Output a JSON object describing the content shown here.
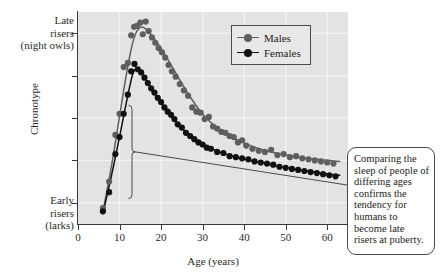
{
  "axes": {
    "y_title": "Chronotype",
    "y_high_label": "Late\nrisers\n(night owls)",
    "y_low_label": "Early\nrisers\n(larks)",
    "x_title": "Age (years)",
    "x_ticks": [
      "0",
      "10",
      "20",
      "30",
      "40",
      "50",
      "60"
    ]
  },
  "legend": {
    "males_label": "Males",
    "females_label": "Females"
  },
  "annotation": {
    "text": "Comparing the sleep of people of differing ages confirms the tendency for humans to become late risers at puberty."
  },
  "colors": {
    "males": "#5e5e5e",
    "females": "#111111",
    "plot_background": "#e3e3e3",
    "gridline": "#f2f2f2",
    "axis": "#3a3a3a"
  },
  "chart_data": {
    "type": "scatter",
    "title": "",
    "xlabel": "Age (years)",
    "ylabel": "Chronotype",
    "xlim": [
      0,
      65
    ],
    "ylim": [
      0,
      10
    ],
    "grid": true,
    "legend_position": "top-right",
    "x_tick_values": [
      0,
      10,
      20,
      30,
      40,
      50,
      60
    ],
    "y_tick_values": [
      1,
      3,
      5,
      7,
      9
    ],
    "annotations": [
      {
        "text": "Comparing the sleep of people of differing ages confirms the tendency for humans to become late risers at puberty.",
        "points_to_x": 13,
        "bracket_x": 13,
        "bracket_y_range": [
          1.2,
          5.6
        ]
      }
    ],
    "series": [
      {
        "name": "Males",
        "color": "#5e5e5e",
        "points": [
          [
            6.0,
            0.75
          ],
          [
            7.5,
            2.0
          ],
          [
            9.0,
            4.2
          ],
          [
            10.0,
            5.2
          ],
          [
            11.0,
            7.4
          ],
          [
            12.0,
            7.6
          ],
          [
            12.8,
            8.9
          ],
          [
            13.5,
            9.3
          ],
          [
            14.2,
            9.35
          ],
          [
            15.0,
            9.5
          ],
          [
            15.6,
            8.95
          ],
          [
            16.3,
            9.55
          ],
          [
            17.0,
            9.1
          ],
          [
            17.8,
            8.8
          ],
          [
            18.6,
            8.55
          ],
          [
            19.4,
            8.3
          ],
          [
            20.2,
            8.1
          ],
          [
            21.0,
            7.85
          ],
          [
            21.8,
            7.5
          ],
          [
            22.6,
            7.2
          ],
          [
            23.5,
            6.95
          ],
          [
            24.5,
            6.6
          ],
          [
            25.5,
            6.3
          ],
          [
            26.5,
            6.05
          ],
          [
            27.5,
            5.5
          ],
          [
            28.5,
            5.3
          ],
          [
            29.5,
            5.25
          ],
          [
            30.5,
            4.95
          ],
          [
            31.5,
            5.05
          ],
          [
            32.5,
            4.6
          ],
          [
            33.5,
            4.5
          ],
          [
            34.5,
            4.35
          ],
          [
            35.5,
            4.3
          ],
          [
            36.5,
            4.15
          ],
          [
            37.5,
            4.1
          ],
          [
            38.5,
            3.85
          ],
          [
            39.5,
            3.95
          ],
          [
            40.5,
            3.7
          ],
          [
            42.0,
            3.55
          ],
          [
            43.5,
            3.45
          ],
          [
            45.0,
            3.4
          ],
          [
            46.5,
            3.5
          ],
          [
            48.0,
            3.25
          ],
          [
            49.5,
            3.3
          ],
          [
            51.0,
            3.15
          ],
          [
            52.5,
            3.2
          ],
          [
            54.0,
            3.1
          ],
          [
            55.5,
            3.05
          ],
          [
            57.0,
            3.0
          ],
          [
            58.5,
            2.95
          ],
          [
            60.0,
            2.9
          ],
          [
            61.5,
            2.85
          ]
        ],
        "fit_line": [
          [
            6.0,
            0.6
          ],
          [
            8.0,
            2.6
          ],
          [
            10.0,
            5.1
          ],
          [
            12.0,
            7.5
          ],
          [
            13.5,
            8.9
          ],
          [
            15.0,
            9.35
          ],
          [
            16.5,
            9.2
          ],
          [
            18.0,
            8.85
          ],
          [
            20.0,
            8.3
          ],
          [
            23.0,
            7.3
          ],
          [
            26.0,
            6.3
          ],
          [
            29.0,
            5.4
          ],
          [
            32.0,
            4.75
          ],
          [
            36.0,
            4.2
          ],
          [
            40.0,
            3.8
          ],
          [
            45.0,
            3.45
          ],
          [
            50.0,
            3.25
          ],
          [
            55.0,
            3.1
          ],
          [
            60.0,
            3.0
          ],
          [
            63.0,
            2.95
          ]
        ]
      },
      {
        "name": "Females",
        "color": "#111111",
        "points": [
          [
            6.0,
            0.6
          ],
          [
            7.5,
            1.5
          ],
          [
            9.0,
            3.3
          ],
          [
            10.0,
            4.1
          ],
          [
            11.0,
            5.2
          ],
          [
            12.0,
            6.1
          ],
          [
            12.8,
            7.2
          ],
          [
            13.6,
            7.55
          ],
          [
            14.4,
            7.3
          ],
          [
            15.2,
            7.15
          ],
          [
            16.0,
            6.9
          ],
          [
            16.8,
            6.65
          ],
          [
            17.6,
            6.4
          ],
          [
            18.4,
            6.2
          ],
          [
            19.2,
            5.95
          ],
          [
            20.0,
            5.75
          ],
          [
            20.8,
            5.5
          ],
          [
            21.6,
            5.3
          ],
          [
            22.4,
            5.15
          ],
          [
            23.2,
            4.95
          ],
          [
            24.0,
            4.7
          ],
          [
            25.0,
            4.55
          ],
          [
            26.0,
            4.3
          ],
          [
            27.0,
            4.15
          ],
          [
            28.0,
            4.0
          ],
          [
            29.0,
            3.85
          ],
          [
            30.0,
            3.75
          ],
          [
            31.0,
            3.6
          ],
          [
            32.0,
            3.55
          ],
          [
            33.5,
            3.4
          ],
          [
            35.0,
            3.35
          ],
          [
            36.5,
            3.2
          ],
          [
            38.0,
            3.15
          ],
          [
            39.5,
            3.1
          ],
          [
            41.0,
            3.05
          ],
          [
            42.5,
            2.95
          ],
          [
            44.0,
            2.9
          ],
          [
            45.5,
            2.85
          ],
          [
            47.0,
            2.8
          ],
          [
            48.5,
            2.7
          ],
          [
            50.0,
            2.65
          ],
          [
            51.5,
            2.6
          ],
          [
            53.0,
            2.55
          ],
          [
            54.5,
            2.5
          ],
          [
            56.0,
            2.45
          ],
          [
            57.5,
            2.4
          ],
          [
            59.0,
            2.35
          ],
          [
            60.5,
            2.3
          ],
          [
            62.0,
            2.25
          ]
        ],
        "fit_line": [
          [
            6.0,
            0.5
          ],
          [
            8.0,
            2.2
          ],
          [
            10.0,
            4.1
          ],
          [
            12.0,
            6.1
          ],
          [
            13.5,
            7.4
          ],
          [
            15.0,
            7.25
          ],
          [
            17.0,
            6.6
          ],
          [
            19.0,
            6.0
          ],
          [
            22.0,
            5.2
          ],
          [
            25.0,
            4.5
          ],
          [
            28.0,
            4.0
          ],
          [
            32.0,
            3.55
          ],
          [
            36.0,
            3.25
          ],
          [
            40.0,
            3.05
          ],
          [
            45.0,
            2.85
          ],
          [
            50.0,
            2.65
          ],
          [
            55.0,
            2.5
          ],
          [
            60.0,
            2.35
          ],
          [
            63.0,
            2.3
          ]
        ]
      }
    ]
  }
}
